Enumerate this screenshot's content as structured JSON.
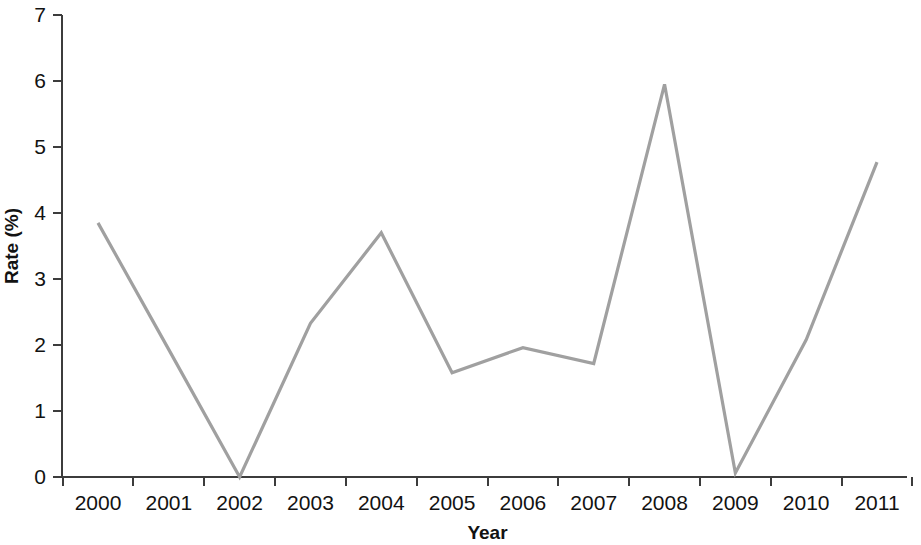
{
  "chart_data": {
    "type": "line",
    "title": "",
    "subtitle": "",
    "xlabel": "Year",
    "ylabel": "Rate (%)",
    "x": [
      2000,
      2001,
      2002,
      2003,
      2004,
      2005,
      2006,
      2007,
      2008,
      2009,
      2010,
      2011
    ],
    "categories": [
      "2000",
      "2001",
      "2002",
      "2003",
      "2004",
      "2005",
      "2006",
      "2007",
      "2008",
      "2009",
      "2010",
      "2011"
    ],
    "values": [
      3.85,
      1.93,
      0.0,
      2.33,
      3.7,
      1.58,
      1.96,
      1.72,
      5.95,
      0.06,
      2.08,
      4.77
    ],
    "series": [
      {
        "name": "Rate",
        "color": "#a0a0a0",
        "values": [
          3.85,
          1.93,
          0.0,
          2.33,
          3.7,
          1.58,
          1.96,
          1.72,
          5.95,
          0.06,
          2.08,
          4.77
        ]
      }
    ],
    "xlim": [
      2000,
      2011
    ],
    "ylim": [
      0,
      7
    ],
    "ytick_labels": [
      "0",
      "1",
      "2",
      "3",
      "4",
      "5",
      "6",
      "7"
    ],
    "yticks": [
      0,
      1,
      2,
      3,
      4,
      5,
      6,
      7
    ],
    "xtick_labels": [
      "2000",
      "2001",
      "2002",
      "2003",
      "2004",
      "2005",
      "2006",
      "2007",
      "2008",
      "2009",
      "2010",
      "2011"
    ],
    "grid": false,
    "legend": false,
    "legend_position": "none",
    "markers": false,
    "line_color": "#a0a0a0",
    "axis_color": "#3c3c3c",
    "background_color": "#ffffff"
  }
}
